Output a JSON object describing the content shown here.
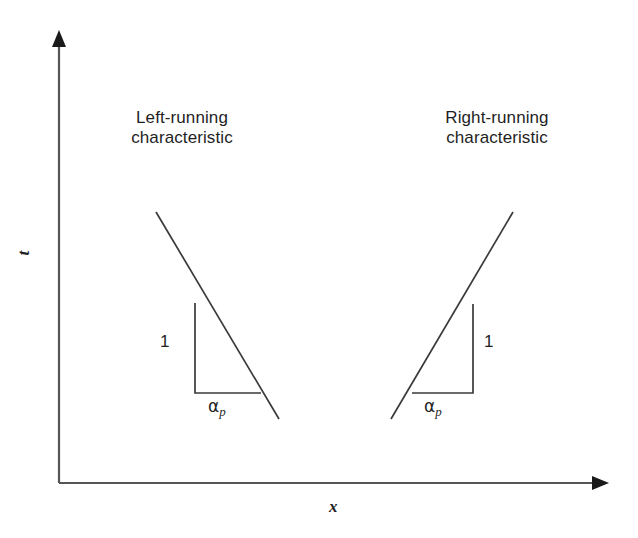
{
  "figure": {
    "type": "x-t characteristics diagram",
    "background_color": "#ffffff",
    "line_color": "#3a3a3a",
    "text_color": "#1f1f1f"
  },
  "axes": {
    "x_label": "x",
    "t_label": "t",
    "origin": {
      "x": 59,
      "y": 483
    },
    "x_axis_end": {
      "x": 607,
      "y": 483
    },
    "t_axis_top": {
      "x": 59,
      "y": 33
    },
    "arrowheads": [
      "x-axis-right",
      "t-axis-up"
    ]
  },
  "annotations": {
    "left_title_line1": "Left-running",
    "left_title_line2": "characteristic",
    "right_title_line1": "Right-running",
    "right_title_line2": "characteristic",
    "rise_label_left": "1",
    "rise_label_right": "1",
    "run_label_left_symbol": "α",
    "run_label_left_subscript": "p",
    "run_label_right_symbol": "α",
    "run_label_right_subscript": "p"
  },
  "geometry": {
    "left_characteristic": {
      "x1": 156,
      "y1": 212,
      "x2": 279,
      "y2": 419
    },
    "right_characteristic": {
      "x1": 391,
      "y1": 419,
      "x2": 513,
      "y2": 212
    },
    "left_triangle": {
      "vertical": {
        "x1": 195,
        "y1": 303,
        "x2": 195,
        "y2": 393
      },
      "horizontal": {
        "x1": 195,
        "y1": 393,
        "x2": 261,
        "y2": 393
      }
    },
    "right_triangle": {
      "vertical": {
        "x1": 473,
        "y1": 304,
        "x2": 473,
        "y2": 393
      },
      "horizontal": {
        "x1": 412,
        "y1": 393,
        "x2": 473,
        "y2": 393
      }
    }
  }
}
